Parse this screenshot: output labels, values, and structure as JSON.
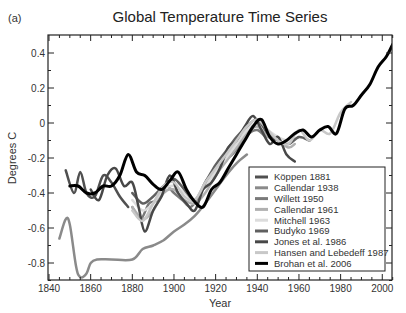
{
  "panel_label": "(a)",
  "chart_data": {
    "type": "line",
    "title": "Global Temperature Time Series",
    "xlabel": "Year",
    "ylabel": "Degrees C",
    "xlim": [
      1840,
      2005
    ],
    "ylim": [
      -0.9,
      0.5
    ],
    "xticks": [
      1840,
      1860,
      1880,
      1900,
      1920,
      1940,
      1960,
      1980,
      2000
    ],
    "yticks": [
      0.4,
      0.2,
      0,
      -0.2,
      -0.4,
      -0.6,
      -0.8
    ],
    "ytick_labels": [
      "0.4",
      "0.2",
      "0",
      "-0.2",
      "-0.4",
      "-0.6",
      "-0.8"
    ],
    "legend_position": "lower right",
    "series": [
      {
        "name": "Köppen 1881",
        "color": "#505050",
        "width": 2.5,
        "x": [
          1848,
          1852,
          1855,
          1858,
          1862,
          1866,
          1870,
          1874,
          1878
        ],
        "y": [
          -0.27,
          -0.4,
          -0.28,
          -0.4,
          -0.42,
          -0.3,
          -0.34,
          -0.42,
          -0.48
        ]
      },
      {
        "name": "Callendar 1938",
        "color": "#8a8a8a",
        "width": 2.5,
        "x": [
          1845,
          1848,
          1850,
          1853,
          1855,
          1858,
          1860,
          1863,
          1870,
          1880,
          1885,
          1890,
          1895,
          1900,
          1905,
          1910,
          1915,
          1920,
          1925,
          1930,
          1935
        ],
        "y": [
          -0.66,
          -0.55,
          -0.58,
          -0.82,
          -0.88,
          -0.86,
          -0.8,
          -0.78,
          -0.78,
          -0.78,
          -0.72,
          -0.7,
          -0.67,
          -0.62,
          -0.58,
          -0.53,
          -0.46,
          -0.38,
          -0.3,
          -0.23,
          -0.18
        ]
      },
      {
        "name": "Willett 1950",
        "color": "#7a7a7a",
        "width": 2.5,
        "x": [
          1880,
          1884,
          1888,
          1892,
          1896,
          1900,
          1904,
          1908,
          1912,
          1916,
          1920,
          1924,
          1928,
          1932,
          1936,
          1940,
          1944
        ],
        "y": [
          -0.48,
          -0.55,
          -0.46,
          -0.44,
          -0.36,
          -0.4,
          -0.44,
          -0.48,
          -0.42,
          -0.32,
          -0.3,
          -0.22,
          -0.18,
          -0.12,
          -0.06,
          -0.04,
          -0.08
        ]
      },
      {
        "name": "Callendar 1961",
        "color": "#b0b0b0",
        "width": 2.5,
        "x": [
          1880,
          1885,
          1890,
          1895,
          1900,
          1905,
          1910,
          1915,
          1920,
          1925,
          1930,
          1935,
          1940,
          1945,
          1950,
          1955,
          1958
        ],
        "y": [
          -0.48,
          -0.55,
          -0.5,
          -0.4,
          -0.38,
          -0.44,
          -0.46,
          -0.4,
          -0.3,
          -0.22,
          -0.14,
          -0.06,
          -0.02,
          -0.08,
          -0.1,
          -0.14,
          -0.12
        ]
      },
      {
        "name": "Mitchell 1963",
        "color": "#dcdcdc",
        "width": 2.5,
        "x": [
          1880,
          1885,
          1890,
          1895,
          1900,
          1905,
          1910,
          1915,
          1920,
          1925,
          1930,
          1935,
          1940,
          1945,
          1950,
          1955,
          1960
        ],
        "y": [
          -0.44,
          -0.5,
          -0.46,
          -0.38,
          -0.36,
          -0.4,
          -0.44,
          -0.36,
          -0.28,
          -0.2,
          -0.12,
          -0.04,
          0.0,
          -0.04,
          -0.08,
          -0.1,
          -0.08
        ]
      },
      {
        "name": "Budyko 1969",
        "color": "#606060",
        "width": 2.5,
        "x": [
          1880,
          1885,
          1890,
          1895,
          1900,
          1905,
          1910,
          1915,
          1920,
          1925,
          1930,
          1935,
          1940,
          1945,
          1950,
          1955,
          1960,
          1965
        ],
        "y": [
          -0.4,
          -0.46,
          -0.42,
          -0.36,
          -0.32,
          -0.38,
          -0.44,
          -0.34,
          -0.24,
          -0.16,
          -0.08,
          -0.02,
          0.02,
          -0.06,
          -0.1,
          -0.12,
          -0.08,
          -0.1
        ]
      },
      {
        "name": "Jones et al. 1986",
        "color": "#484848",
        "width": 2.5,
        "x": [
          1860,
          1864,
          1868,
          1872,
          1876,
          1880,
          1883,
          1886,
          1890,
          1894,
          1898,
          1902,
          1906,
          1910,
          1914,
          1918,
          1922,
          1926,
          1930,
          1934,
          1938,
          1942,
          1946,
          1950,
          1954,
          1958
        ],
        "y": [
          -0.38,
          -0.44,
          -0.3,
          -0.26,
          -0.36,
          -0.34,
          -0.48,
          -0.62,
          -0.5,
          -0.42,
          -0.3,
          -0.4,
          -0.46,
          -0.5,
          -0.38,
          -0.34,
          -0.26,
          -0.14,
          -0.1,
          -0.02,
          0.04,
          -0.04,
          -0.12,
          -0.08,
          -0.18,
          -0.22
        ]
      },
      {
        "name": "Hansen and Lebedeff 1987",
        "color": "#c8c8c8",
        "width": 2.5,
        "x": [
          1880,
          1885,
          1890,
          1895,
          1900,
          1905,
          1910,
          1915,
          1920,
          1925,
          1930,
          1935,
          1940,
          1945,
          1950,
          1955,
          1960,
          1965,
          1970,
          1975,
          1980,
          1985
        ],
        "y": [
          -0.5,
          -0.56,
          -0.46,
          -0.36,
          -0.34,
          -0.42,
          -0.44,
          -0.34,
          -0.26,
          -0.18,
          -0.1,
          -0.02,
          0.02,
          -0.04,
          -0.1,
          -0.12,
          -0.04,
          -0.1,
          -0.04,
          -0.06,
          0.06,
          0.12
        ]
      },
      {
        "name": "Brohan et al. 2006",
        "color": "#000000",
        "width": 3,
        "x": [
          1850,
          1854,
          1858,
          1862,
          1866,
          1870,
          1874,
          1878,
          1882,
          1886,
          1890,
          1894,
          1898,
          1902,
          1906,
          1910,
          1914,
          1918,
          1922,
          1926,
          1930,
          1934,
          1938,
          1942,
          1946,
          1950,
          1954,
          1958,
          1962,
          1966,
          1970,
          1974,
          1978,
          1982,
          1986,
          1990,
          1994,
          1998,
          2002,
          2005
        ],
        "y": [
          -0.36,
          -0.36,
          -0.4,
          -0.4,
          -0.36,
          -0.36,
          -0.3,
          -0.18,
          -0.28,
          -0.3,
          -0.35,
          -0.38,
          -0.33,
          -0.28,
          -0.38,
          -0.45,
          -0.48,
          -0.38,
          -0.34,
          -0.26,
          -0.18,
          -0.1,
          -0.02,
          0.02,
          -0.08,
          -0.12,
          -0.1,
          -0.06,
          -0.04,
          -0.08,
          -0.04,
          -0.02,
          -0.06,
          0.08,
          0.1,
          0.16,
          0.22,
          0.32,
          0.38,
          0.45
        ]
      }
    ]
  }
}
